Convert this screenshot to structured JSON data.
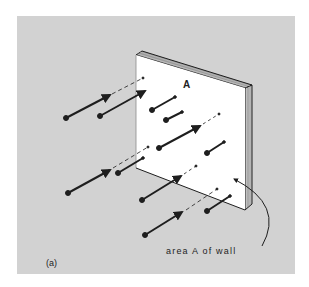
{
  "figure": {
    "panel_label": "(a)",
    "wall_label": "A",
    "annotation": "area A of wall",
    "colors": {
      "background": "#ffffff",
      "panel": "#d2d2d2",
      "wall_face": "#ffffff",
      "ink": "#1e1e1e"
    }
  }
}
